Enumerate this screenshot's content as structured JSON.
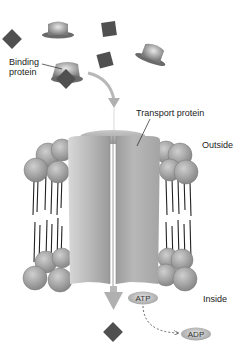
{
  "diagram": {
    "type": "membrane-transport-illustration",
    "labels": {
      "binding_protein_line1": "Binding",
      "binding_protein_line2": "protein",
      "transport_protein": "Transport protein",
      "outside": "Outside",
      "inside": "Inside",
      "atp": "ATP",
      "adp": "ADP"
    },
    "icons": {
      "solute": "diamond-shape",
      "binding_protein": "hat-shape",
      "lipid": "sphere-with-tails"
    },
    "colors": {
      "solute": "#505050",
      "protein": "#9a9a9a",
      "lipid_head": "#a8a8a8",
      "arrow": "#b0b0b0",
      "text": "#222222"
    }
  }
}
